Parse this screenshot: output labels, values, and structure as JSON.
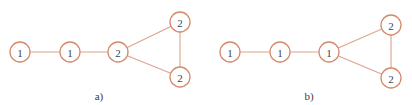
{
  "colors": {
    "node_stroke": "#d58a6c",
    "edge": "#dba48c",
    "text": "#3b4252",
    "background": "#ffffff"
  },
  "node_radius": 10,
  "panels": [
    {
      "label": "a)",
      "label_pos": [
        99,
        96
      ],
      "nodes": [
        {
          "id": "a1",
          "label": "1",
          "x": 20,
          "y": 52
        },
        {
          "id": "a2",
          "label": "1",
          "x": 70,
          "y": 52
        },
        {
          "id": "a3",
          "label": "2",
          "x": 118,
          "y": 52
        },
        {
          "id": "a4",
          "label": "2",
          "x": 180,
          "y": 22
        },
        {
          "id": "a5",
          "label": "2",
          "x": 180,
          "y": 77
        }
      ],
      "edges": [
        [
          "a1",
          "a2"
        ],
        [
          "a2",
          "a3"
        ],
        [
          "a3",
          "a4"
        ],
        [
          "a3",
          "a5"
        ],
        [
          "a4",
          "a5"
        ]
      ]
    },
    {
      "label": "b)",
      "label_pos": [
        309,
        96
      ],
      "nodes": [
        {
          "id": "b1",
          "label": "1",
          "x": 230,
          "y": 52
        },
        {
          "id": "b2",
          "label": "1",
          "x": 280,
          "y": 52
        },
        {
          "id": "b3",
          "label": "1",
          "x": 329,
          "y": 52
        },
        {
          "id": "b4",
          "label": "2",
          "x": 391,
          "y": 25
        },
        {
          "id": "b5",
          "label": "2",
          "x": 391,
          "y": 78
        }
      ],
      "edges": [
        [
          "b1",
          "b2"
        ],
        [
          "b2",
          "b3"
        ],
        [
          "b3",
          "b4"
        ],
        [
          "b3",
          "b5"
        ],
        [
          "b4",
          "b5"
        ]
      ]
    }
  ]
}
